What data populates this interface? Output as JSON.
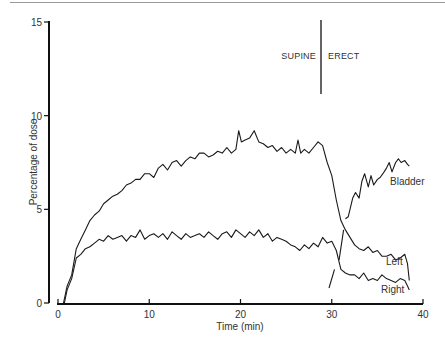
{
  "chart_data": {
    "type": "line",
    "title": "",
    "xlabel": "Time (min)",
    "ylabel": "Percentage of dose",
    "xlim": [
      0,
      40
    ],
    "ylim": [
      0,
      15
    ],
    "xticks": [
      0,
      10,
      20,
      30,
      40
    ],
    "yticks": [
      0,
      5,
      10,
      15
    ],
    "grid": false,
    "legend": "inline labels at curve ends",
    "annotations": [
      {
        "text": "SUPINE",
        "x": 28.5,
        "y": 13.2
      },
      {
        "text": "ERECT",
        "x": 31.3,
        "y": 13.2
      },
      {
        "type": "vertical-line",
        "x": 29.1,
        "y_range": [
          11.2,
          15.2
        ]
      }
    ],
    "series": [
      {
        "name": "Left",
        "x": [
          0.6,
          1.0,
          1.5,
          2.0,
          2.5,
          3.0,
          3.5,
          4.0,
          4.5,
          5.0,
          5.5,
          6.0,
          6.5,
          7.0,
          7.5,
          8.0,
          8.5,
          9.0,
          9.5,
          10.0,
          10.5,
          11.0,
          11.5,
          12.0,
          12.5,
          13.0,
          13.5,
          14.0,
          14.5,
          15.0,
          15.5,
          16.0,
          16.5,
          17.0,
          17.5,
          18.0,
          18.5,
          19.0,
          19.5,
          19.8,
          20.1,
          20.5,
          21.0,
          21.5,
          22.0,
          22.5,
          23.0,
          23.5,
          24.0,
          24.5,
          25.0,
          25.5,
          26.0,
          26.3,
          26.6,
          27.0,
          27.5,
          28.0,
          28.5,
          29.0,
          29.5,
          30.0,
          30.5,
          31.0,
          31.5,
          32.0,
          32.5,
          33.0,
          33.5,
          34.0,
          34.5,
          35.0,
          35.5,
          36.0,
          36.5,
          37.0,
          37.5,
          38.0,
          38.3,
          38.5
        ],
        "values": [
          0.0,
          0.9,
          1.5,
          2.9,
          3.4,
          3.9,
          4.4,
          4.7,
          4.9,
          5.3,
          5.5,
          5.7,
          5.8,
          6.0,
          6.3,
          6.4,
          6.6,
          6.6,
          6.9,
          6.9,
          6.7,
          7.2,
          7.4,
          7.1,
          7.5,
          7.6,
          7.3,
          7.6,
          7.8,
          7.7,
          8.0,
          8.0,
          7.8,
          7.9,
          8.1,
          8.0,
          8.3,
          8.0,
          8.2,
          9.2,
          8.6,
          8.7,
          8.8,
          9.2,
          8.6,
          8.5,
          8.3,
          8.4,
          8.1,
          8.3,
          8.0,
          8.2,
          8.0,
          8.7,
          8.0,
          8.2,
          8.0,
          8.3,
          8.6,
          8.4,
          7.5,
          6.8,
          5.5,
          4.4,
          3.9,
          3.5,
          3.1,
          2.9,
          2.8,
          3.0,
          2.7,
          2.8,
          2.5,
          2.5,
          2.6,
          2.3,
          2.4,
          2.6,
          2.1,
          1.2
        ]
      },
      {
        "name": "Right",
        "x": [
          0.7,
          1.0,
          1.5,
          2.0,
          2.5,
          3.0,
          3.5,
          4.0,
          4.5,
          5.0,
          5.5,
          6.0,
          6.5,
          7.0,
          7.5,
          8.0,
          8.5,
          9.0,
          9.5,
          10.0,
          10.5,
          11.0,
          11.5,
          12.0,
          12.5,
          13.0,
          13.5,
          14.0,
          14.5,
          15.0,
          15.5,
          16.0,
          16.5,
          17.0,
          17.5,
          18.0,
          18.5,
          19.0,
          19.5,
          20.0,
          20.5,
          21.0,
          21.5,
          22.0,
          22.5,
          23.0,
          23.5,
          24.0,
          24.5,
          25.0,
          25.5,
          26.0,
          26.5,
          27.0,
          27.5,
          28.0,
          28.5,
          29.0,
          29.5,
          30.0,
          30.5,
          31.0,
          31.5,
          32.0,
          32.5,
          33.0,
          33.5,
          34.0,
          34.5,
          35.0,
          35.5,
          36.0,
          36.5,
          37.0,
          37.5,
          38.0,
          38.3,
          38.5
        ],
        "values": [
          0.0,
          0.7,
          1.3,
          2.4,
          2.6,
          2.9,
          3.0,
          3.2,
          3.4,
          3.3,
          3.6,
          3.4,
          3.5,
          3.6,
          3.3,
          3.6,
          3.5,
          3.9,
          3.4,
          3.6,
          3.7,
          3.5,
          3.7,
          3.4,
          3.8,
          3.6,
          3.4,
          3.7,
          3.5,
          3.6,
          3.7,
          3.5,
          3.8,
          3.6,
          3.4,
          3.7,
          3.8,
          3.5,
          3.9,
          3.7,
          3.5,
          3.8,
          3.6,
          3.9,
          3.5,
          3.7,
          3.3,
          3.5,
          3.4,
          3.3,
          3.1,
          3.0,
          2.8,
          3.1,
          2.9,
          3.2,
          3.0,
          3.5,
          3.2,
          3.3,
          2.8,
          1.8,
          1.6,
          1.5,
          1.5,
          1.3,
          1.6,
          1.2,
          1.3,
          1.2,
          1.5,
          1.3,
          1.2,
          1.1,
          1.3,
          1.2,
          0.9,
          0.7
        ]
      },
      {
        "name": "Bladder",
        "x": [
          31.5,
          31.8,
          32.0,
          32.3,
          32.6,
          33.0,
          33.3,
          33.6,
          34.0,
          34.3,
          34.6,
          35.0,
          35.3,
          35.6,
          36.0,
          36.3,
          36.6,
          37.0,
          37.3,
          37.6,
          38.0,
          38.3,
          38.5
        ],
        "values": [
          4.5,
          4.6,
          5.0,
          5.6,
          5.9,
          5.6,
          6.5,
          6.9,
          6.2,
          6.8,
          6.3,
          6.6,
          6.7,
          6.9,
          7.2,
          7.5,
          7.0,
          7.5,
          7.7,
          7.5,
          7.6,
          7.4,
          7.3
        ]
      },
      {
        "name": "transition-segment-upper",
        "x": [
          30.8,
          31.3
        ],
        "values": [
          2.3,
          3.9
        ]
      },
      {
        "name": "transition-segment-lower",
        "x": [
          29.7,
          30.3
        ],
        "values": [
          0.8,
          1.8
        ]
      }
    ]
  },
  "labels": {
    "y_axis_title": "Percentage of dose",
    "x_axis_title": "Time (min)",
    "supine": "SUPINE",
    "erect": "ERECT",
    "bladder": "Bladder",
    "left": "Left",
    "right": "Right",
    "yticks": [
      "0",
      "5",
      "10",
      "15"
    ],
    "xticks": [
      "0",
      "10",
      "20",
      "30",
      "40"
    ]
  }
}
